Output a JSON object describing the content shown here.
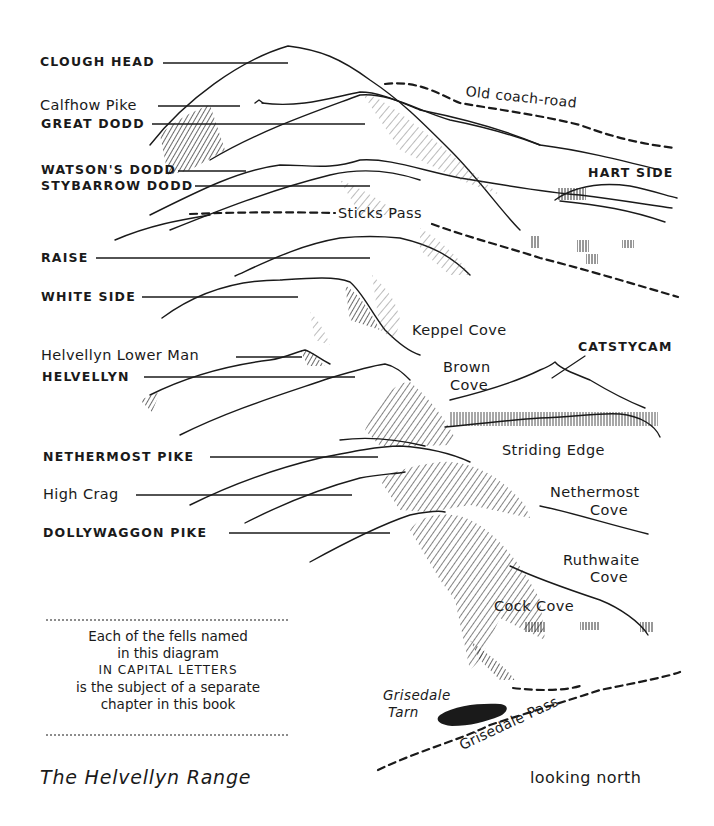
{
  "diagram": {
    "title": "The Helvellyn Range",
    "orientation": "looking north",
    "note": {
      "lines": [
        "Each of the fells named",
        "in this diagram",
        "IN CAPITAL LETTERS",
        "is the subject of a separate",
        "chapter in this book"
      ]
    },
    "fells": [
      {
        "name": "CLOUGH HEAD",
        "capital": true
      },
      {
        "name": "Calfhow Pike",
        "capital": false
      },
      {
        "name": "GREAT DODD",
        "capital": true
      },
      {
        "name": "WATSON'S DODD",
        "capital": true
      },
      {
        "name": "STYBARROW DODD",
        "capital": true
      },
      {
        "name": "HART SIDE",
        "capital": true
      },
      {
        "name": "RAISE",
        "capital": true
      },
      {
        "name": "WHITE SIDE",
        "capital": true
      },
      {
        "name": "Helvellyn Lower Man",
        "capital": false
      },
      {
        "name": "HELVELLYN",
        "capital": true
      },
      {
        "name": "CATSTYCAM",
        "capital": true
      },
      {
        "name": "NETHERMOST PIKE",
        "capital": true
      },
      {
        "name": "High Crag",
        "capital": false
      },
      {
        "name": "DOLLYWAGGON PIKE",
        "capital": true
      }
    ],
    "features": {
      "old_coach_road": "Old coach-road",
      "sticks_pass": "Sticks Pass",
      "keppel_cove": "Keppel Cove",
      "brown_cove": [
        "Brown",
        "Cove"
      ],
      "striding_edge": "Striding Edge",
      "nethermost_cove": [
        "Nethermost",
        "Cove"
      ],
      "ruthwaite_cove": [
        "Ruthwaite",
        "Cove"
      ],
      "cock_cove": "Cock Cove",
      "grisedale_tarn": [
        "Grisedale",
        "Tarn"
      ],
      "grisedale_pass": "Grisedale Pass"
    },
    "colors": {
      "ink": "#1a1a1a",
      "paper": "#ffffff"
    }
  }
}
